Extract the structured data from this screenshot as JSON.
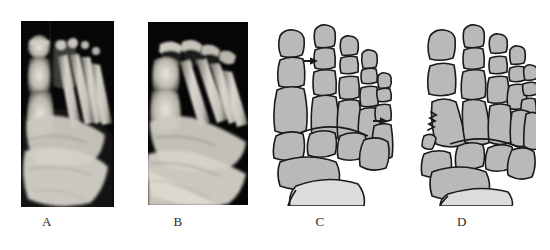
{
  "figure": {
    "background_color": "#ffffff",
    "width": 550,
    "height": 250,
    "type": "medical-radiology-figure"
  },
  "panels": [
    {
      "id": "A",
      "label": "A",
      "kind": "radiograph",
      "view": "anteroposterior-foot",
      "x": 21,
      "y": 21,
      "width": 93,
      "height": 186,
      "label_x": 47,
      "label_y": 214,
      "background_color": "#060606",
      "bone_color": "#d8d6cf"
    },
    {
      "id": "B",
      "label": "B",
      "kind": "radiograph",
      "view": "oblique-foot",
      "x": 148,
      "y": 22,
      "width": 100,
      "height": 183,
      "label_x": 178,
      "label_y": 214,
      "background_color": "#060606",
      "bone_color": "#d9d7d0"
    },
    {
      "id": "C",
      "label": "C",
      "kind": "line-drawing",
      "view": "anteroposterior-foot-schematic",
      "x": 272,
      "y": 14,
      "width": 122,
      "height": 192,
      "label_x": 320,
      "label_y": 214,
      "outline_color": "#1a1a1a",
      "fill_color": "#b9b9b9",
      "fill_color_light": "#dcdcdc"
    },
    {
      "id": "D",
      "label": "D",
      "kind": "line-drawing",
      "view": "anteroposterior-foot-schematic-fracture",
      "x": 418,
      "y": 14,
      "width": 118,
      "height": 192,
      "label_x": 462,
      "label_y": 214,
      "outline_color": "#1a1a1a",
      "fill_color": "#b9b9b9",
      "fill_color_light": "#dcdcdc"
    }
  ],
  "annotations": [
    {
      "panel": "C",
      "name": "arrow-second-toe-proximal-phalanx",
      "direction": "right",
      "target": "proximal phalanx of second toe",
      "x": 303,
      "y": 61,
      "length": 17,
      "color": "#1a1a1a"
    },
    {
      "panel": "C",
      "name": "arrow-fifth-metatarsal",
      "direction": "right",
      "target": "fifth metatarsal shaft",
      "x": 373,
      "y": 121,
      "length": 17,
      "color": "#1a1a1a"
    },
    {
      "panel": "D",
      "name": "fracture-line-first-metatarsal-base",
      "type": "jagged-fracture",
      "target": "base of first metatarsal with displaced fragment",
      "color": "#1a1a1a"
    }
  ],
  "anatomy": {
    "bone_groups": [
      "distal phalanges",
      "middle phalanges",
      "proximal phalanges",
      "metatarsals",
      "cuneiforms",
      "navicular",
      "cuboid",
      "talus",
      "calcaneus"
    ]
  }
}
